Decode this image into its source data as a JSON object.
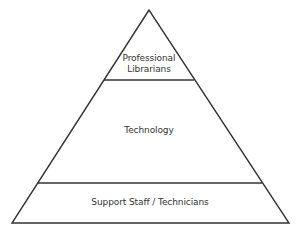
{
  "diagram": {
    "type": "pyramid",
    "levels": [
      {
        "label_line1": "Professional",
        "label_line2": "Librarians"
      },
      {
        "label": "Technology"
      },
      {
        "label": "Support Staff / Technicians"
      }
    ],
    "stroke_color": "#333333"
  }
}
